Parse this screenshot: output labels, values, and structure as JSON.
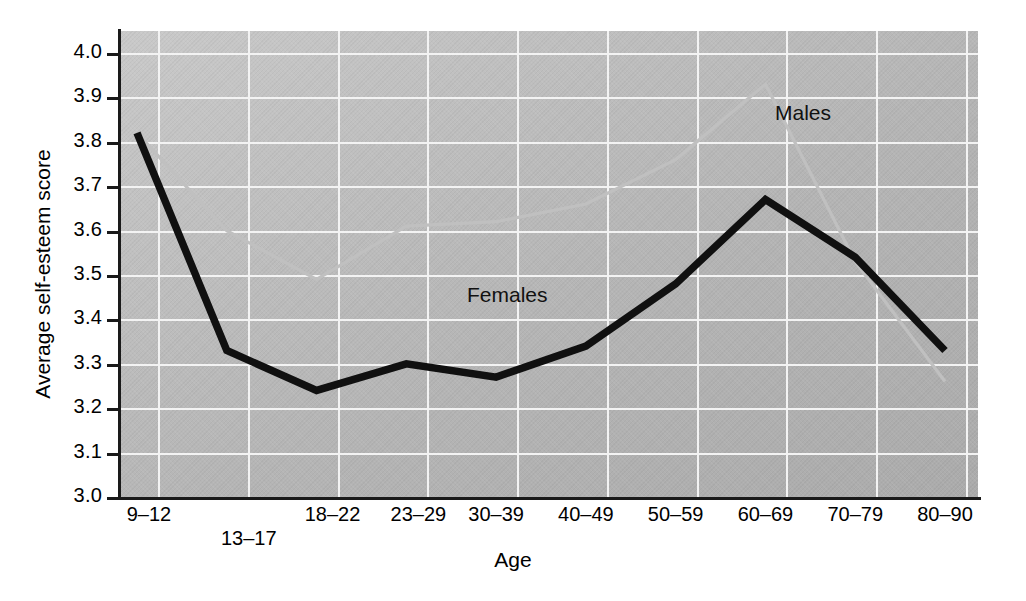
{
  "chart_data": {
    "type": "line",
    "title": "",
    "xlabel": "Age",
    "ylabel": "Average self-esteem score",
    "categories": [
      "9–12",
      "13–17",
      "18–22",
      "23–29",
      "30–39",
      "40–49",
      "50–59",
      "60–69",
      "70–79",
      "80–90"
    ],
    "ylim": [
      3.0,
      4.0
    ],
    "ytick_labels": [
      "3.0",
      "3.1",
      "3.2",
      "3.3",
      "3.4",
      "3.5",
      "3.6",
      "3.7",
      "3.8",
      "3.9",
      "4.0"
    ],
    "ytick_values": [
      3.0,
      3.1,
      3.2,
      3.3,
      3.4,
      3.5,
      3.6,
      3.7,
      3.8,
      3.9,
      4.0
    ],
    "grid": true,
    "legend_position": "inline-annotation",
    "series": [
      {
        "name": "Males",
        "color": "#c0c0c0",
        "values": [
          3.82,
          3.6,
          3.49,
          3.61,
          3.62,
          3.66,
          3.76,
          3.93,
          3.53,
          3.26
        ]
      },
      {
        "name": "Females",
        "color": "#101010",
        "values": [
          3.82,
          3.33,
          3.24,
          3.3,
          3.27,
          3.34,
          3.48,
          3.67,
          3.54,
          3.33
        ]
      }
    ],
    "annotations": [
      {
        "text": "Males",
        "x_category": "70–79",
        "y": 3.85
      },
      {
        "text": "Females",
        "x_category": "40–49",
        "y": 3.44
      }
    ]
  },
  "axes": {
    "x_title": "Age",
    "y_title": "Average self-esteem score"
  },
  "colors": {
    "plot_background": "#b8b8b8",
    "gridline": "#f3f3f3",
    "axis": "#1a1a1a",
    "males_line": "#c0c0c0",
    "females_line": "#101010",
    "text": "#000000"
  }
}
